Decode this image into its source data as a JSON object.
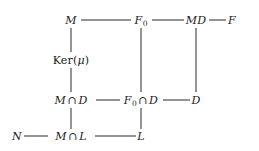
{
  "diagram": {
    "type": "lattice-diagram",
    "background_color": "#ffffff",
    "line_color": "#2b2b2b",
    "text_color": "#1a1a1a",
    "nodes": [
      {
        "id": "M",
        "label": "M",
        "x": 71,
        "y": 20,
        "row": 1,
        "col": 1
      },
      {
        "id": "F0",
        "label": "F₀",
        "x": 141,
        "y": 20,
        "row": 1,
        "col": 2
      },
      {
        "id": "MD",
        "label": "MD",
        "x": 196,
        "y": 20,
        "row": 1,
        "col": 3
      },
      {
        "id": "F",
        "label": "F",
        "x": 232,
        "y": 20,
        "row": 1,
        "col": 4
      },
      {
        "id": "Kermu",
        "label": "Ker(μ)",
        "x": 71,
        "y": 60,
        "row": 2,
        "col": 1
      },
      {
        "id": "MiD",
        "label": "M ∩ D",
        "x": 71,
        "y": 100,
        "row": 3,
        "col": 1
      },
      {
        "id": "F0iD",
        "label": "F₀ ∩ D",
        "x": 141,
        "y": 100,
        "row": 3,
        "col": 2
      },
      {
        "id": "D",
        "label": "D",
        "x": 196,
        "y": 100,
        "row": 3,
        "col": 3
      },
      {
        "id": "N",
        "label": "N",
        "x": 17,
        "y": 136,
        "row": 4,
        "col": 0
      },
      {
        "id": "MiL",
        "label": "M ∩ L",
        "x": 71,
        "y": 136,
        "row": 4,
        "col": 1
      },
      {
        "id": "L",
        "label": "L",
        "x": 141,
        "y": 136,
        "row": 4,
        "col": 2
      }
    ],
    "edges": [
      {
        "id": "M-F0",
        "from": "M",
        "to": "F0",
        "orientation": "horizontal",
        "x1": 81,
        "x2": 131,
        "y": 20
      },
      {
        "id": "F0-MD",
        "from": "F0",
        "to": "MD",
        "orientation": "horizontal",
        "x1": 152,
        "x2": 184,
        "y": 20
      },
      {
        "id": "MD-F",
        "from": "MD",
        "to": "F",
        "orientation": "horizontal",
        "x1": 209,
        "x2": 226,
        "y": 20
      },
      {
        "id": "MiD-F0iD",
        "from": "MiD",
        "to": "F0iD",
        "orientation": "horizontal",
        "x1": 96,
        "x2": 120,
        "y": 100
      },
      {
        "id": "F0iD-D",
        "from": "F0iD",
        "to": "D",
        "orientation": "horizontal",
        "x1": 163,
        "x2": 190,
        "y": 100
      },
      {
        "id": "N-MiL",
        "from": "N",
        "to": "MiL",
        "orientation": "horizontal",
        "x1": 24,
        "x2": 48,
        "y": 136
      },
      {
        "id": "MiL-L",
        "from": "MiL",
        "to": "L",
        "orientation": "horizontal",
        "x1": 95,
        "x2": 136,
        "y": 136
      },
      {
        "id": "M-Kermu",
        "from": "M",
        "to": "Kermu",
        "orientation": "vertical",
        "x": 71,
        "y1": 28,
        "y2": 52
      },
      {
        "id": "Kermu-MiD",
        "from": "Kermu",
        "to": "MiD",
        "orientation": "vertical",
        "x": 71,
        "y1": 68,
        "y2": 92
      },
      {
        "id": "MiD-MiL",
        "from": "MiD",
        "to": "MiL",
        "orientation": "vertical",
        "x": 71,
        "y1": 108,
        "y2": 129
      },
      {
        "id": "F0-F0iD",
        "from": "F0",
        "to": "F0iD",
        "orientation": "vertical",
        "x": 141,
        "y1": 28,
        "y2": 92
      },
      {
        "id": "F0iD-L",
        "from": "F0iD",
        "to": "L",
        "orientation": "vertical",
        "x": 141,
        "y1": 108,
        "y2": 129
      },
      {
        "id": "MD-D",
        "from": "MD",
        "to": "D",
        "orientation": "vertical",
        "x": 196,
        "y1": 28,
        "y2": 92
      }
    ]
  }
}
